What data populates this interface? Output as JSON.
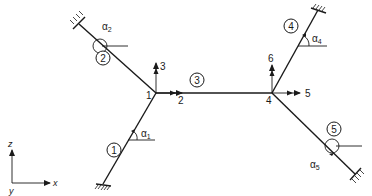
{
  "figure": {
    "type": "space frame / grid structure schematic",
    "colors": {
      "line": "#1a1a1a",
      "background": "#ffffff"
    }
  },
  "nodes": [
    {
      "id": "1",
      "label": "1"
    },
    {
      "id": "4",
      "label": "4"
    }
  ],
  "members": [
    {
      "id": "1",
      "label": "1",
      "from": "support-bottom-left",
      "to": "node-1",
      "angle_label": "α",
      "angle_sub": "1"
    },
    {
      "id": "2",
      "label": "2",
      "from": "support-top-left",
      "to": "node-1",
      "angle_label": "α",
      "angle_sub": "2"
    },
    {
      "id": "3",
      "label": "3",
      "from": "node-1",
      "to": "node-4"
    },
    {
      "id": "4",
      "label": "4",
      "from": "node-4",
      "to": "support-top-right",
      "angle_label": "α",
      "angle_sub": "4"
    },
    {
      "id": "5",
      "label": "5",
      "from": "node-4",
      "to": "support-bottom-right",
      "angle_label": "α",
      "angle_sub": "5"
    }
  ],
  "dofs": [
    {
      "id": "2",
      "label": "2",
      "node": "1",
      "direction": "x"
    },
    {
      "id": "3",
      "label": "3",
      "node": "1",
      "direction": "z"
    },
    {
      "id": "5",
      "label": "5",
      "node": "4",
      "direction": "x"
    },
    {
      "id": "6",
      "label": "6",
      "node": "4",
      "direction": "z"
    }
  ],
  "axes": {
    "z": "z",
    "x": "x",
    "y": "y"
  }
}
